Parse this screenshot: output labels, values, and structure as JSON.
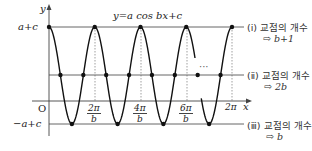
{
  "equation": "y=a cos bx+c",
  "axes": {
    "y_label": "y",
    "x_label": "x",
    "origin_label": "O"
  },
  "levels": {
    "max": "a+c",
    "min": "−a+c"
  },
  "x_ticks": [
    {
      "num": "2π",
      "den": "b"
    },
    {
      "num": "4π",
      "den": "b"
    },
    {
      "num": "6π",
      "den": "b"
    },
    {
      "label": "2π"
    }
  ],
  "ellipsis": "···",
  "annotations": [
    {
      "roman": "(ⅰ)",
      "text": "교점의 개수",
      "result": "⇨ b+1"
    },
    {
      "roman": "(ⅱ)",
      "text": "교점의 개수",
      "result": "⇨ 2b"
    },
    {
      "roman": "(ⅲ)",
      "text": "교점의 개수",
      "result": "⇨ b"
    }
  ],
  "chart_data": {
    "type": "line",
    "title": "y=a cos bx+c",
    "xlabel": "x",
    "ylabel": "y",
    "function": "a*cos(b*x)+c",
    "x_tick_labels": [
      "O",
      "2π/b",
      "4π/b",
      "6π/b",
      "2π"
    ],
    "y_tick_labels": [
      "a+c",
      "−a+c"
    ],
    "horizontal_lines": [
      {
        "y": "a+c",
        "label": "(ⅰ) 교점의 개수 ⇨ b+1"
      },
      {
        "y": "c",
        "label": "(ⅱ) 교점의 개수 ⇨ 2b"
      },
      {
        "y": "−a+c",
        "label": "(ⅲ) 교점의 개수 ⇨ b"
      }
    ],
    "visible_periods": 4,
    "grid": false
  }
}
